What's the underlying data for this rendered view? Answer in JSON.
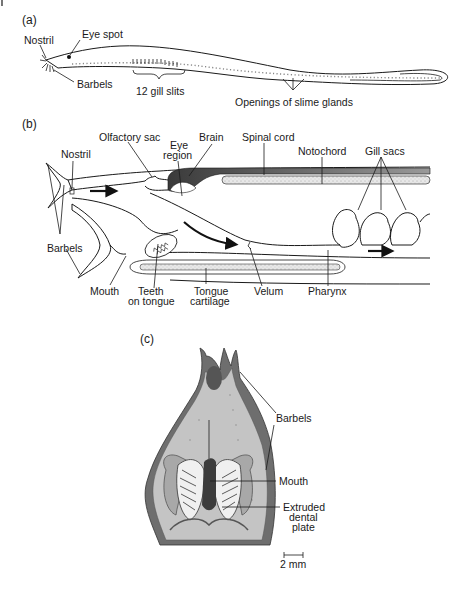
{
  "figure": {
    "panel_a": {
      "label": "(a)",
      "labels": {
        "nostril": "Nostril",
        "eye_spot": "Eye spot",
        "barbels": "Barbels",
        "gill_slits": "12 gill slits",
        "slime_glands": "Openings of slime glands"
      }
    },
    "panel_b": {
      "label": "(b)",
      "labels": {
        "olfactory_sac": "Olfactory sac",
        "brain": "Brain",
        "spinal_cord": "Spinal cord",
        "eye_region_1": "Eye",
        "eye_region_2": "region",
        "nostril": "Nostril",
        "notochord": "Notochord",
        "gill_sacs": "Gill sacs",
        "barbels": "Barbels",
        "mouth": "Mouth",
        "teeth_1": "Teeth",
        "teeth_2": "on tongue",
        "tongue_cart_1": "Tongue",
        "tongue_cart_2": "cartilage",
        "velum": "Velum",
        "pharynx": "Pharynx"
      }
    },
    "panel_c": {
      "label": "(c)",
      "labels": {
        "barbels": "Barbels",
        "mouth": "Mouth",
        "dental_1": "Extruded",
        "dental_2": "dental",
        "dental_3": "plate",
        "scale": "2 mm"
      }
    },
    "colors": {
      "line": "#1a1a1a",
      "dark_gray": "#555555",
      "mid_gray": "#8a8a8a",
      "light_gray": "#c4c4c4",
      "stipple": "#e4e4e4"
    }
  }
}
